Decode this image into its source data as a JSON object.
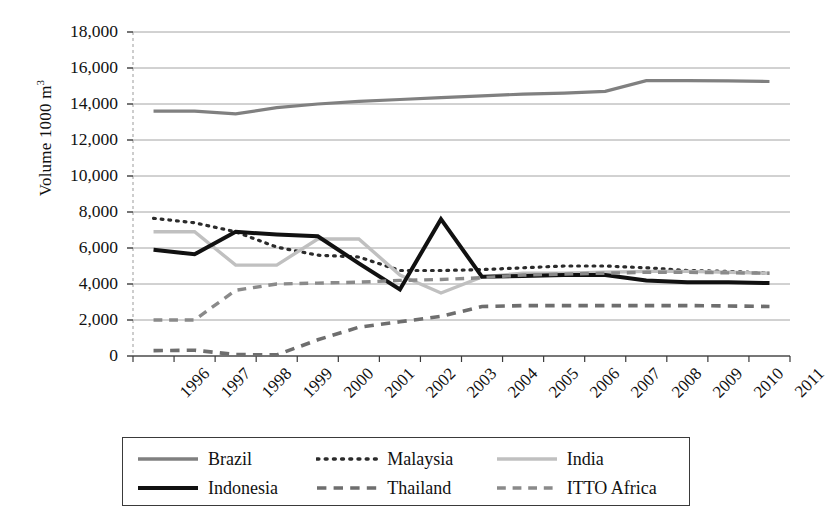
{
  "chart_data": {
    "type": "line",
    "title": "",
    "xlabel": "",
    "ylabel": "Volume 1000 m3",
    "ylabel_display": "Volume 1000 m",
    "ylabel_superscript": "3",
    "x": [
      "1996",
      "1997",
      "1998",
      "1999",
      "2000",
      "2001",
      "2002",
      "2003",
      "2004",
      "2005",
      "2006",
      "2007",
      "2008",
      "2009",
      "2010",
      "2011"
    ],
    "categories": [
      "1996",
      "1997",
      "1998",
      "1999",
      "2000",
      "2001",
      "2002",
      "2003",
      "2004",
      "2005",
      "2006",
      "2007",
      "2008",
      "2009",
      "2010",
      "2011"
    ],
    "ylim": [
      0,
      18000
    ],
    "ytick_values": [
      0,
      2000,
      4000,
      6000,
      8000,
      10000,
      12000,
      14000,
      16000,
      18000
    ],
    "ytick_labels": [
      "0",
      "2,000",
      "4,000",
      "6,000",
      "8,000",
      "10,000",
      "12,000",
      "14,000",
      "16,000",
      "18,000"
    ],
    "grid": "horizontal",
    "legend_position": "bottom",
    "series": [
      {
        "name": "Brazil",
        "color": "#808080",
        "style": "solid",
        "width": 3.2,
        "values": [
          13600,
          13600,
          13450,
          13800,
          14000,
          14150,
          14250,
          14350,
          14450,
          14550,
          14600,
          14700,
          15300,
          15300,
          15280,
          15250
        ]
      },
      {
        "name": "Malaysia",
        "color": "#2b2b2b",
        "style": "dotted",
        "width": 3.2,
        "values": [
          7650,
          7400,
          6900,
          6050,
          5600,
          5500,
          4750,
          4750,
          4800,
          4900,
          5000,
          5000,
          4900,
          4750,
          4700,
          4600
        ]
      },
      {
        "name": "India",
        "color": "#c0c0c0",
        "style": "solid",
        "width": 3.4,
        "values": [
          6900,
          6900,
          5050,
          5050,
          6500,
          6500,
          4500,
          3500,
          4400,
          4600,
          4600,
          4650,
          4700,
          4700,
          4650,
          4600
        ]
      },
      {
        "name": "Indonesia",
        "color": "#111111",
        "style": "solid",
        "width": 4.0,
        "values": [
          5900,
          5650,
          6900,
          6750,
          6650,
          5150,
          3700,
          7600,
          4400,
          4450,
          4500,
          4500,
          4200,
          4100,
          4100,
          4050
        ]
      },
      {
        "name": "Thailand",
        "color": "#6e6e6e",
        "style": "dashed",
        "width": 3.6,
        "values": [
          300,
          320,
          80,
          60,
          900,
          1600,
          1900,
          2200,
          2750,
          2800,
          2800,
          2800,
          2800,
          2800,
          2780,
          2750
        ]
      },
      {
        "name": "ITTO Africa",
        "color": "#8a8a8a",
        "style": "dashed",
        "width": 3.4,
        "values": [
          2000,
          2000,
          3650,
          4000,
          4050,
          4100,
          4200,
          4250,
          4350,
          4500,
          4550,
          4600,
          4650,
          4650,
          4620,
          4600
        ]
      }
    ]
  },
  "legend": {
    "items": [
      {
        "label": "Brazil",
        "swatch": "solid-gray-line"
      },
      {
        "label": "Malaysia",
        "swatch": "dotted-dark-line"
      },
      {
        "label": "India",
        "swatch": "solid-lightgray-line"
      },
      {
        "label": "Indonesia",
        "swatch": "solid-black-line"
      },
      {
        "label": "Thailand",
        "swatch": "dashed-gray-line"
      },
      {
        "label": "ITTO Africa",
        "swatch": "dashed-gray-line"
      }
    ]
  }
}
